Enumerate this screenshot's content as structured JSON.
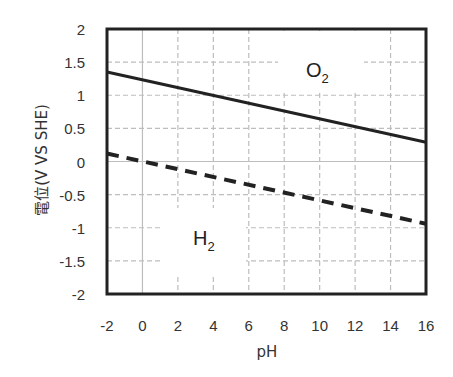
{
  "chart_data": {
    "type": "line",
    "title": "",
    "xlabel": "pH",
    "ylabel": "電位(V VS SHE)",
    "xlim": [
      -2,
      16
    ],
    "ylim": [
      -2,
      2
    ],
    "x_ticks": [
      -2,
      0,
      2,
      4,
      6,
      8,
      10,
      12,
      14,
      16
    ],
    "x_tick_labels": [
      "-2",
      "0",
      "2",
      "4",
      "6",
      "8",
      "10",
      "12",
      "14",
      "16"
    ],
    "y_ticks": [
      2,
      1.5,
      1,
      0.5,
      0,
      -0.5,
      -1,
      -1.5,
      -2
    ],
    "y_tick_labels": [
      "2",
      "1.5",
      "1",
      "0.5",
      "0",
      "-0.5",
      "-1",
      "-1.5",
      "-2"
    ],
    "grid": true,
    "legend": null,
    "series": [
      {
        "name": "O2/H2O",
        "style": "solid",
        "color": "#222222",
        "x": [
          -2,
          16
        ],
        "values": [
          1.35,
          0.29
        ]
      },
      {
        "name": "H+/H2",
        "style": "dashed",
        "color": "#222222",
        "x": [
          -2,
          16
        ],
        "values": [
          0.12,
          -0.94
        ]
      }
    ],
    "annotations": [
      {
        "text": "O",
        "subscript": "2",
        "x": 8.5,
        "y": 1.45
      },
      {
        "text": "H",
        "subscript": "2",
        "x": 5.5,
        "y": -1.0
      }
    ]
  },
  "labels": {
    "o2_main": "O",
    "o2_sub": "2",
    "h2_main": "H",
    "h2_sub": "2"
  }
}
